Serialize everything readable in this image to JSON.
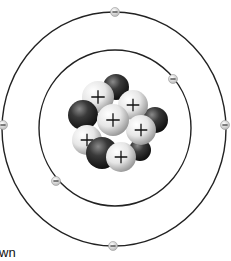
{
  "diagram": {
    "type": "bohr-atom-model",
    "caption_fragment": "wn",
    "colors": {
      "background": "#ffffff",
      "orbit": "#222222",
      "proton_light": "#f2f2f2",
      "proton_mid": "#b8b8b8",
      "neutron_dark": "#1c1c1c",
      "neutron_mid": "#6a6a6a",
      "electron": "#d8d8d8",
      "sign": "#111111"
    },
    "orbits": [
      {
        "name": "inner-shell",
        "cx": 115,
        "cy": 128,
        "rx": 76,
        "ry": 78
      },
      {
        "name": "outer-shell",
        "cx": 114,
        "cy": 129,
        "rx": 112,
        "ry": 117
      }
    ],
    "electrons": [
      {
        "shell": "outer",
        "x": 115,
        "y": 12,
        "sign": "−"
      },
      {
        "shell": "outer",
        "x": 3,
        "y": 125,
        "sign": "−"
      },
      {
        "shell": "outer",
        "x": 225,
        "y": 125,
        "sign": "−"
      },
      {
        "shell": "outer",
        "x": 113,
        "y": 246,
        "sign": "−"
      },
      {
        "shell": "inner",
        "x": 173,
        "y": 79,
        "sign": "−"
      },
      {
        "shell": "inner",
        "x": 56,
        "y": 181,
        "sign": "−"
      }
    ],
    "nucleus": [
      {
        "kind": "neutron",
        "x": 116,
        "y": 87,
        "r": 13
      },
      {
        "kind": "proton",
        "x": 98,
        "y": 97,
        "r": 16,
        "sign": "+"
      },
      {
        "kind": "neutron",
        "x": 155,
        "y": 120,
        "r": 13
      },
      {
        "kind": "proton",
        "x": 133,
        "y": 105,
        "r": 15,
        "sign": "+"
      },
      {
        "kind": "neutron",
        "x": 83,
        "y": 115,
        "r": 15
      },
      {
        "kind": "neutron",
        "x": 140,
        "y": 150,
        "r": 11
      },
      {
        "kind": "proton",
        "x": 87,
        "y": 140,
        "r": 15,
        "sign": "+"
      },
      {
        "kind": "proton",
        "x": 141,
        "y": 130,
        "r": 15,
        "sign": "+"
      },
      {
        "kind": "proton",
        "x": 113,
        "y": 120,
        "r": 16,
        "sign": "+"
      },
      {
        "kind": "neutron",
        "x": 102,
        "y": 153,
        "r": 16
      },
      {
        "kind": "proton",
        "x": 121,
        "y": 157,
        "r": 15,
        "sign": "+"
      }
    ],
    "counts": {
      "protons": 6,
      "neutrons": 5,
      "electrons": 6
    }
  }
}
